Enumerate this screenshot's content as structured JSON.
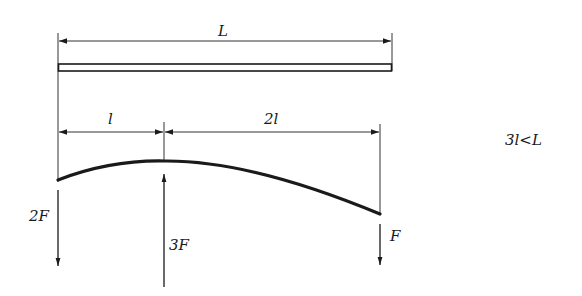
{
  "diagram": {
    "dimensions": {
      "total_length": "L",
      "left_segment": "l",
      "right_segment": "2l"
    },
    "forces": [
      {
        "label": "2F",
        "direction": "down",
        "position": "left end"
      },
      {
        "label": "3F",
        "direction": "up",
        "position": "at l from left"
      },
      {
        "label": "F",
        "direction": "down",
        "position": "at 3l from left"
      }
    ],
    "condition": "3l<L",
    "colors": {
      "ink": "#1a1a1a",
      "background": "#ffffff"
    }
  }
}
